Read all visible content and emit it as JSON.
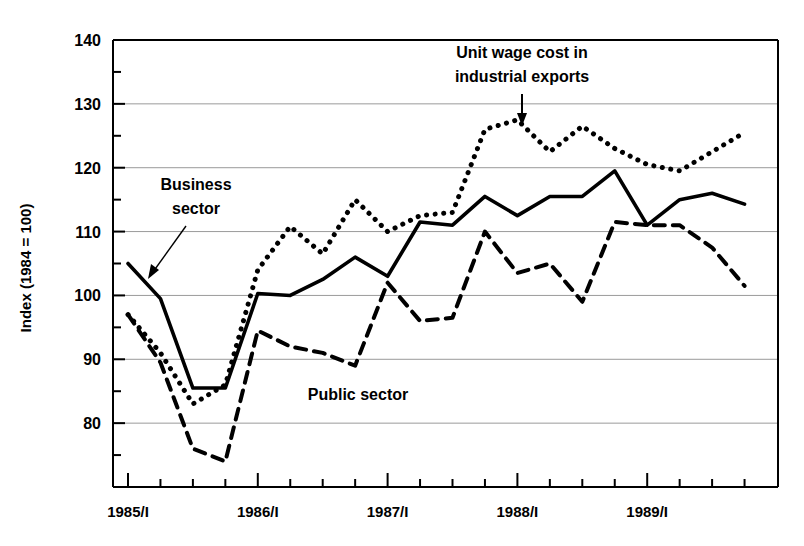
{
  "chart_data": {
    "type": "line",
    "title": "",
    "xlabel": "",
    "ylabel": "Index (1984 = 100)",
    "ylim": [
      70,
      140
    ],
    "yticks": [
      80,
      90,
      100,
      110,
      120,
      130,
      140
    ],
    "yticks_minor": [
      75,
      85,
      95,
      105,
      115,
      125,
      135
    ],
    "grid": true,
    "legend_position": "inline-annotations",
    "x": [
      "1985/I",
      "1985/II",
      "1985/III",
      "1985/IV",
      "1986/I",
      "1986/II",
      "1986/III",
      "1986/IV",
      "1987/I",
      "1987/II",
      "1987/III",
      "1987/IV",
      "1988/I",
      "1988/II",
      "1988/III",
      "1988/IV",
      "1989/I",
      "1989/II",
      "1989/III",
      "1989/IV"
    ],
    "xtick_labels": [
      "1985/I",
      "1986/I",
      "1987/I",
      "1988/I",
      "1989/I"
    ],
    "xtick_label_index": [
      0,
      4,
      8,
      12,
      16
    ],
    "series": [
      {
        "name": "Business sector",
        "style": "solid",
        "color": "#000000",
        "values": [
          105.0,
          99.5,
          85.5,
          85.5,
          100.3,
          100.0,
          102.5,
          106.0,
          103.0,
          111.5,
          111.0,
          115.5,
          112.5,
          115.5,
          115.5,
          119.5,
          111.0,
          115.0,
          116.0,
          114.3
        ]
      },
      {
        "name": "Unit wage cost in industrial exports",
        "style": "dotted",
        "color": "#000000",
        "values": [
          97.0,
          91.0,
          83.0,
          86.0,
          104.0,
          110.8,
          106.5,
          115.0,
          110.0,
          112.5,
          113.0,
          126.0,
          127.5,
          122.5,
          126.5,
          123.0,
          120.5,
          119.5,
          122.5,
          125.5
        ]
      },
      {
        "name": "Public sector",
        "style": "dashed",
        "color": "#000000",
        "values": [
          97.0,
          89.5,
          76.0,
          74.0,
          94.5,
          92.0,
          91.0,
          89.0,
          102.0,
          96.0,
          96.5,
          110.0,
          103.5,
          105.0,
          99.0,
          111.5,
          111.0,
          111.0,
          107.5,
          101.5
        ]
      }
    ],
    "annotations": [
      {
        "id": "unit-wage-cost-annotation",
        "text_lines": [
          "Unit wage cost in",
          "industrial exports"
        ],
        "arrow": "down"
      },
      {
        "id": "business-sector-annotation",
        "text_lines": [
          "Business",
          "sector"
        ],
        "arrow": "diagonal-down-right"
      },
      {
        "id": "public-sector-annotation",
        "text_lines": [
          "Public sector"
        ],
        "arrow": "none"
      }
    ]
  }
}
